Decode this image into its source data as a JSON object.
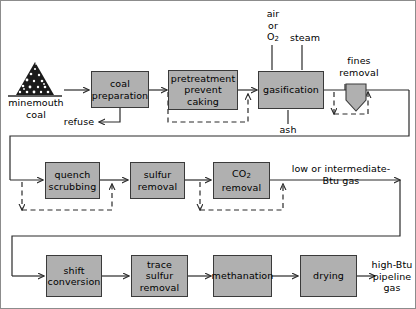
{
  "diagram": {
    "type": "process-flowchart",
    "colors": {
      "box_fill": "#b0b0b0",
      "box_border": "#3a3a3a",
      "line": "#2a2a2a",
      "dashed_line": "#2a2a2a",
      "frame": "#8c8c8c",
      "background": "#ffffff"
    }
  },
  "row1": {
    "feed_label": "minemouth\ncoal",
    "feed_icon": "coal-pile-icon",
    "boxes": [
      {
        "id": "coal-preparation",
        "label": "coal\npreparation"
      },
      {
        "id": "pretreatment-prevent-caking",
        "label": "pretreatment\nprevent\ncaking"
      },
      {
        "id": "gasification",
        "label": "gasification"
      }
    ],
    "cyclone": {
      "id": "fines-removal",
      "label": "fines\nremoval"
    },
    "inputs": {
      "air_or_o2": "air\nor\nO",
      "air_or_o2_sub": "2",
      "steam": "steam"
    },
    "outputs": {
      "refuse": "refuse",
      "ash": "ash"
    }
  },
  "row2": {
    "boxes": [
      {
        "id": "quench-scrubbing",
        "label": "quench\nscrubbing"
      },
      {
        "id": "sulfur-removal",
        "label": "sulfur\nremoval"
      },
      {
        "id": "co2-removal",
        "label_pre": "CO",
        "label_sub": "2",
        "label_post": "\nremoval"
      }
    ],
    "product": "low or intermediate-\nBtu gas"
  },
  "row3": {
    "boxes": [
      {
        "id": "shift-conversion",
        "label": "shift\nconversion"
      },
      {
        "id": "trace-sulfur-removal",
        "label": "trace\nsulfur\nremoval"
      },
      {
        "id": "methanation",
        "label": "methanation"
      },
      {
        "id": "drying",
        "label": "drying"
      }
    ],
    "product": "high-Btu\npipeline\ngas"
  }
}
